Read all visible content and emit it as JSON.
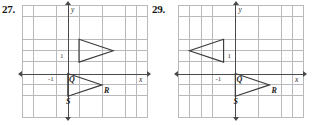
{
  "page": {
    "background_color": "#ffffff",
    "grid_color": "#b9b9bd",
    "axis_color": "#4a4a4a",
    "figure_stroke_color": "#3d3d3d"
  },
  "problems": [
    {
      "number": "27.",
      "graph": {
        "x_axis_label": "x",
        "y_axis_label": "y",
        "x_tick_label": "-1",
        "y_tick_label": "1",
        "origin_label": "Q",
        "grid_cell_px": 11.4,
        "x_range": [
          -5,
          5
        ],
        "y_range": [
          -5,
          4
        ],
        "shapes": [
          {
            "name": "triangle-image",
            "points_grid": [
              [
                1,
                3
              ],
              [
                1,
                1
              ],
              [
                4,
                2
              ]
            ],
            "labels": []
          },
          {
            "name": "triangle-preimage-QSR",
            "points_grid": [
              [
                0,
                0
              ],
              [
                0,
                -2
              ],
              [
                3,
                -1
              ]
            ],
            "labels": [
              {
                "text": "Q",
                "vertex": 0
              },
              {
                "text": "S",
                "vertex": 1
              },
              {
                "text": "R",
                "vertex": 2
              }
            ]
          }
        ]
      }
    },
    {
      "number": "29.",
      "graph": {
        "x_axis_label": "x",
        "y_axis_label": "y",
        "x_tick_label": "-1",
        "y_tick_label": "1",
        "origin_label": "Q",
        "grid_cell_px": 11.4,
        "x_range": [
          -5,
          5
        ],
        "y_range": [
          -5,
          4
        ],
        "shapes": [
          {
            "name": "triangle-image",
            "points_grid": [
              [
                -1,
                3
              ],
              [
                -1,
                1
              ],
              [
                -4,
                2
              ]
            ],
            "labels": []
          },
          {
            "name": "triangle-preimage-QSR",
            "points_grid": [
              [
                0,
                0
              ],
              [
                0,
                -2
              ],
              [
                3,
                -1
              ]
            ],
            "labels": [
              {
                "text": "Q",
                "vertex": 0
              },
              {
                "text": "S",
                "vertex": 1
              },
              {
                "text": "R",
                "vertex": 2
              }
            ]
          }
        ]
      }
    }
  ]
}
